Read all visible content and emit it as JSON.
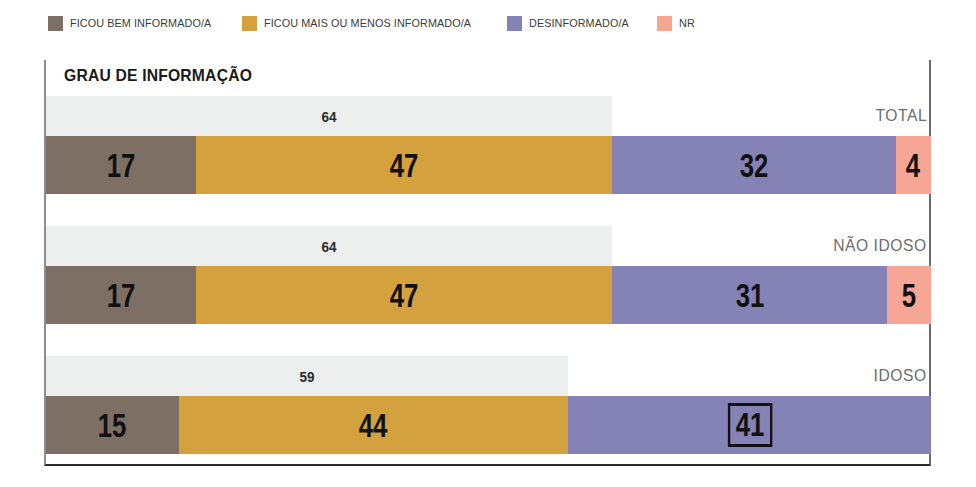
{
  "legend": {
    "items": [
      {
        "label": "FICOU BEM INFORMADO/A",
        "color": "#7d6f63",
        "icon": "legend-swatch-icon"
      },
      {
        "label": "FICOU MAIS OU MENOS INFORMADO/A",
        "color": "#d3a23f",
        "icon": "legend-swatch-icon"
      },
      {
        "label": "DESINFORMADO/A",
        "color": "#8582b5",
        "icon": "legend-swatch-icon"
      },
      {
        "label": "NR",
        "color": "#f7a595",
        "icon": "legend-swatch-icon"
      }
    ]
  },
  "chart_title": "GRAU DE INFORMAÇÃO",
  "chart_data": {
    "type": "bar",
    "orientation": "horizontal",
    "stacked": true,
    "title": "GRAU DE INFORMAÇÃO",
    "xlabel": "",
    "ylabel": "",
    "xlim": [
      0,
      100
    ],
    "grid": false,
    "legend_position": "top-left",
    "categories": [
      "TOTAL",
      "NÃO IDOSO",
      "IDOSO"
    ],
    "series": [
      {
        "name": "FICOU BEM INFORMADO/A",
        "color": "#7d6f63",
        "values": [
          17,
          17,
          15
        ]
      },
      {
        "name": "FICOU MAIS OU MENOS INFORMADO/A",
        "color": "#d3a23f",
        "values": [
          47,
          47,
          44
        ]
      },
      {
        "name": "DESINFORMADO/A",
        "color": "#8582b5",
        "values": [
          32,
          31,
          41
        ]
      },
      {
        "name": "NR",
        "color": "#f7a595",
        "values": [
          4,
          5,
          0
        ]
      }
    ],
    "summary_bars": {
      "label": "FICOU BEM + MAIS OU MENOS INFORMADO/A",
      "color": "#edeeee",
      "values": [
        64,
        64,
        59
      ]
    },
    "annotations": [
      {
        "category": "IDOSO",
        "series": "DESINFORMADO/A",
        "value": 41,
        "style": "black-box-outline"
      }
    ]
  },
  "groups": [
    {
      "label": "TOTAL",
      "summary": {
        "value": "64",
        "pct": 64
      },
      "segments": [
        {
          "name": "FICOU BEM INFORMADO/A",
          "value": "17",
          "pct": 17,
          "color": "#7d6f63",
          "boxed": false
        },
        {
          "name": "FICOU MAIS OU MENOS INFORMADO/A",
          "value": "47",
          "pct": 47,
          "color": "#d3a23f",
          "boxed": false
        },
        {
          "name": "DESINFORMADO/A",
          "value": "32",
          "pct": 32,
          "color": "#8582b5",
          "boxed": false
        },
        {
          "name": "NR",
          "value": "4",
          "pct": 4,
          "color": "#f7a595",
          "boxed": false
        }
      ]
    },
    {
      "label": "NÃO IDOSO",
      "summary": {
        "value": "64",
        "pct": 64
      },
      "segments": [
        {
          "name": "FICOU BEM INFORMADO/A",
          "value": "17",
          "pct": 17,
          "color": "#7d6f63",
          "boxed": false
        },
        {
          "name": "FICOU MAIS OU MENOS INFORMADO/A",
          "value": "47",
          "pct": 47,
          "color": "#d3a23f",
          "boxed": false
        },
        {
          "name": "DESINFORMADO/A",
          "value": "31",
          "pct": 31,
          "color": "#8582b5",
          "boxed": false
        },
        {
          "name": "NR",
          "value": "5",
          "pct": 5,
          "color": "#f7a595",
          "boxed": false
        }
      ]
    },
    {
      "label": "IDOSO",
      "summary": {
        "value": "59",
        "pct": 59
      },
      "segments": [
        {
          "name": "FICOU BEM INFORMADO/A",
          "value": "15",
          "pct": 15,
          "color": "#7d6f63",
          "boxed": false
        },
        {
          "name": "FICOU MAIS OU MENOS INFORMADO/A",
          "value": "44",
          "pct": 44,
          "color": "#d3a23f",
          "boxed": false
        },
        {
          "name": "DESINFORMADO/A",
          "value": "41",
          "pct": 41,
          "color": "#8582b5",
          "boxed": true
        }
      ]
    }
  ],
  "layout": {
    "group_tops": [
      0,
      130,
      260
    ],
    "summary_bar_color": "#edeeee",
    "frame_color": "#2b2b2b"
  }
}
